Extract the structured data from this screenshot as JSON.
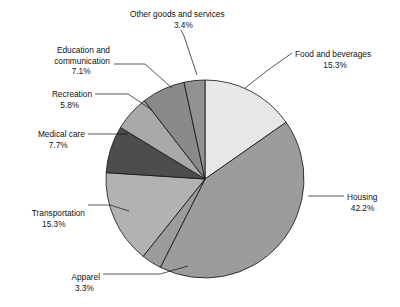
{
  "chart_data": {
    "type": "pie",
    "title": "",
    "categories": [
      "Food and beverages",
      "Housing",
      "Apparel",
      "Transportation",
      "Medical care",
      "Recreation",
      "Education and communication",
      "Other goods and services"
    ],
    "values": [
      15.3,
      42.2,
      3.3,
      15.3,
      7.7,
      5.8,
      7.1,
      3.4
    ],
    "value_labels": [
      "15.3%",
      "42.2%",
      "3.3%",
      "15.3%",
      "7.7%",
      "5.8%",
      "7.1%",
      "3.4%"
    ],
    "unit": "%",
    "total": 100.1,
    "start_angle_deg": 0,
    "direction": "clockwise",
    "legend": "none",
    "grid": false,
    "colors": [
      "#e7e7e7",
      "#9c9c9c",
      "#9c9c9c",
      "#b2b2b2",
      "#4d4d4d",
      "#a9a9a9",
      "#8a8a8a",
      "#929292"
    ],
    "outline_color": "#111111",
    "geometry": {
      "cx": 205,
      "cy": 179,
      "r": 99
    }
  },
  "slices": [
    {
      "name": "food-and-beverages",
      "label": "Food and beverages",
      "value_label": "15.3%",
      "label_x": 295,
      "label_y": 57,
      "label_anchor": "start",
      "leader": "M 245,88 L 268,70 L 292,53"
    },
    {
      "name": "housing",
      "label": "Housing",
      "value_label": "42.2%",
      "label_x": 347,
      "label_y": 200,
      "label_anchor": "start",
      "leader": "M 308,196 L 344,196"
    },
    {
      "name": "apparel",
      "label": "Apparel",
      "value_label": "3.3%",
      "label_x": 100,
      "label_y": 280,
      "label_anchor": "end",
      "leader": "M 188,266 L 160,274 L 103,274"
    },
    {
      "name": "transportation",
      "label": "Transportation",
      "value_label": "15.3%",
      "label_x": 85,
      "label_y": 216,
      "label_anchor": "end",
      "leader": "M 129,211 L 110,205 L 88,205"
    },
    {
      "name": "medical-care",
      "label": "Medical care",
      "value_label": "7.7%",
      "label_x": 85,
      "label_y": 137,
      "label_anchor": "end",
      "leader": "M 128,134 L 88,134"
    },
    {
      "name": "recreation",
      "label": "Recreation",
      "value_label": "5.8%",
      "label_x": 92,
      "label_y": 97,
      "label_anchor": "end",
      "leader": "M 152,110 L 128,94 L 95,94"
    },
    {
      "name": "education-and-communication",
      "label_line1": "Education and",
      "label_line2": "communication",
      "label": "Education and communication",
      "value_label": "7.1%",
      "label_x": 110,
      "label_y": 53,
      "label_anchor": "end",
      "leader": "M 172,88 L 145,64 L 114,64"
    },
    {
      "name": "other-goods-and-services",
      "label": "Other goods and services",
      "value_label": "3.4%",
      "label_x": 130,
      "label_y": 17,
      "label_anchor": "start",
      "leader": "M 197,75 L 184,36 L 181,30"
    }
  ]
}
